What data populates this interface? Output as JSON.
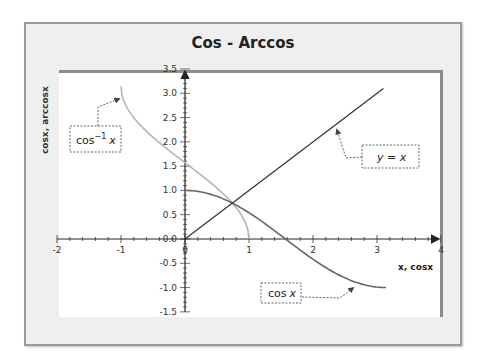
{
  "chart_data": {
    "type": "line",
    "title": "Cos - Arccos",
    "xlabel": "x, cosx",
    "ylabel": "cosx, arccosx",
    "xlim": [
      -2,
      4
    ],
    "ylim": [
      -1.5,
      3.5
    ],
    "x_ticks": [
      "-2",
      "-1",
      "0",
      "1",
      "2",
      "3",
      "4"
    ],
    "y_ticks": [
      "3.5",
      "3.0",
      "2.5",
      "2.0",
      "1.5",
      "1.0",
      "0.5",
      "0.0",
      "-0.5",
      "-1.0",
      "-1.5"
    ],
    "grid": false,
    "legend": "none (callout annotations)",
    "series": [
      {
        "name": "cos x",
        "function": "y = cos(x)",
        "x_range": [
          0,
          3.1416
        ],
        "color": "#666666",
        "x": [
          0,
          0.5,
          1.0,
          1.5708,
          2.0,
          2.5,
          3.1416
        ],
        "y": [
          1.0,
          0.878,
          0.54,
          0.0,
          -0.416,
          -0.801,
          -1.0
        ]
      },
      {
        "name": "cos^-1 x",
        "function": "y = arccos(x)",
        "x_range": [
          -1,
          1
        ],
        "color": "#b5b5b5",
        "x": [
          -1,
          -0.5,
          0,
          0.5,
          1
        ],
        "y": [
          3.1416,
          2.094,
          1.5708,
          1.047,
          0.0
        ]
      },
      {
        "name": "y = x",
        "function": "y = x",
        "x_range": [
          0,
          3.1
        ],
        "color": "#333333",
        "x": [
          0,
          1,
          2,
          3.1
        ],
        "y": [
          0,
          1,
          2,
          3.1
        ]
      }
    ],
    "annotations": [
      {
        "text_main": "cos",
        "text_sup": "−1",
        "text_var": "x",
        "target": "arccos curve"
      },
      {
        "text": "y = x",
        "target": "identity line"
      },
      {
        "text_main": "cos",
        "text_var": "x",
        "target": "cos curve"
      }
    ]
  }
}
